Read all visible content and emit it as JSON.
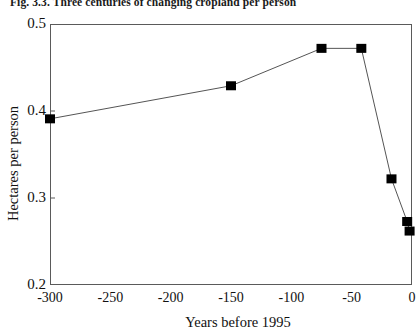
{
  "figure": {
    "caption": "Fig. 3.3.  Three centuries of changing cropland per person"
  },
  "chart_data": {
    "type": "line",
    "title": "Fig. 3.3.  Three centuries of changing cropland per person",
    "xlabel": "Years before 1995",
    "ylabel": "Hectares per person",
    "xlim": [
      -300,
      0
    ],
    "ylim": [
      0.2,
      0.5
    ],
    "grid": false,
    "legend": "none",
    "marker": "filled-square",
    "line_color": "#555555",
    "marker_color": "#000000",
    "xticks": [
      "-300",
      "-250",
      "-200",
      "-150",
      "-100",
      "-50",
      "0"
    ],
    "xtick_values": [
      -300,
      -250,
      -200,
      -150,
      -100,
      -50,
      0
    ],
    "yticks": [
      "0.2",
      "0.3",
      "0.4",
      "0.5"
    ],
    "ytick_values": [
      0.2,
      0.3,
      0.4,
      0.5
    ],
    "series": [
      {
        "name": "Cropland per person",
        "points": [
          {
            "x": -300,
            "y": 0.391
          },
          {
            "x": -150,
            "y": 0.429
          },
          {
            "x": -75,
            "y": 0.472
          },
          {
            "x": -42,
            "y": 0.472
          },
          {
            "x": -17,
            "y": 0.322
          },
          {
            "x": -4,
            "y": 0.273
          },
          {
            "x": -2,
            "y": 0.262
          }
        ]
      }
    ]
  }
}
